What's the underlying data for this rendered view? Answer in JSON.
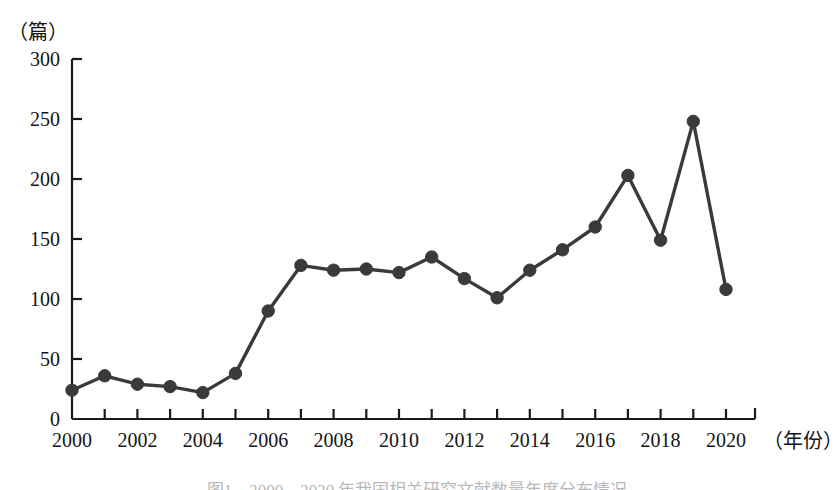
{
  "chart_data": {
    "type": "line",
    "title": "",
    "xlabel": "（年份）",
    "ylabel": "（篇）",
    "x": [
      2000,
      2001,
      2002,
      2003,
      2004,
      2005,
      2006,
      2007,
      2008,
      2009,
      2010,
      2011,
      2012,
      2013,
      2014,
      2015,
      2016,
      2017,
      2018,
      2019,
      2020
    ],
    "values": [
      24,
      36,
      29,
      27,
      22,
      38,
      90,
      128,
      124,
      125,
      122,
      135,
      117,
      101,
      124,
      141,
      160,
      203,
      149,
      248,
      108
    ],
    "series": [
      {
        "name": "发文量",
        "values": [
          24,
          36,
          29,
          27,
          22,
          38,
          90,
          128,
          124,
          125,
          122,
          135,
          117,
          101,
          124,
          141,
          160,
          203,
          149,
          248,
          108
        ]
      }
    ],
    "xlim": [
      2000,
      2021
    ],
    "ylim": [
      0,
      300
    ],
    "yticks": [
      0,
      50,
      100,
      150,
      200,
      250,
      300
    ],
    "ytick_labels": [
      "0",
      "50",
      "100",
      "150",
      "200",
      "250",
      "300"
    ],
    "xticks": [
      2000,
      2001,
      2002,
      2003,
      2004,
      2005,
      2006,
      2007,
      2008,
      2009,
      2010,
      2011,
      2012,
      2013,
      2014,
      2015,
      2016,
      2017,
      2018,
      2019,
      2020
    ],
    "xtick_labels": [
      "2000",
      "",
      "2002",
      "",
      "2004",
      "",
      "2006",
      "",
      "2008",
      "",
      "2010",
      "",
      "2012",
      "",
      "2014",
      "",
      "2016",
      "",
      "2018",
      "",
      "2020"
    ],
    "grid": false,
    "legend": false,
    "legend_position": "none",
    "line_color": "#3a3a3a",
    "marker_color": "#3a3a3a",
    "marker_shape": "circle",
    "axis_color": "#1a1a1a"
  },
  "axes": {
    "y_unit": "（篇）",
    "x_unit": "（年份）"
  },
  "caption": {
    "text": "图1　2000—2020 年我国相关研究文献数量年度分布情况"
  }
}
